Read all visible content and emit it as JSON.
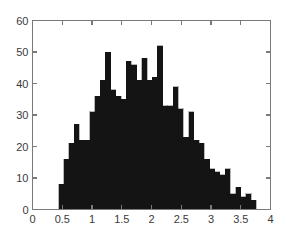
{
  "figure": {
    "background_color": "#ffffff",
    "axis_color": "#7a7a7a",
    "bar_color": "#141414",
    "tick_label_color": "#3a3a3a"
  },
  "chart_data": {
    "type": "bar",
    "title": "",
    "subtitle": "",
    "xlabel": "",
    "ylabel": "",
    "xlim": [
      0,
      4
    ],
    "ylim": [
      0,
      60
    ],
    "grid": false,
    "legend": null,
    "legend_position": "none",
    "xticks": [
      0,
      0.5,
      1,
      1.5,
      2,
      2.5,
      3,
      3.5,
      4
    ],
    "xtick_labels": [
      "0",
      "0.5",
      "1",
      "1.5",
      "2",
      "2.5",
      "3",
      "3.5",
      "4"
    ],
    "yticks": [
      0,
      10,
      20,
      30,
      40,
      50,
      60
    ],
    "ytick_labels": [
      "0",
      "10",
      "20",
      "30",
      "40",
      "50",
      "60"
    ],
    "bin_width": 0.0875,
    "bin_edges": [
      0.4375,
      0.525,
      0.6125,
      0.7,
      0.7875,
      0.875,
      0.9625,
      1.05,
      1.1375,
      1.225,
      1.3125,
      1.4,
      1.4875,
      1.575,
      1.6625,
      1.75,
      1.8375,
      1.925,
      2.0125,
      2.1,
      2.1875,
      2.275,
      2.3625,
      2.45,
      2.5375,
      2.625,
      2.7125,
      2.8,
      2.8875,
      2.975,
      3.0625,
      3.15,
      3.2375,
      3.325,
      3.4125,
      3.5,
      3.5875,
      3.675,
      3.7625
    ],
    "categories": [
      "0.44-0.53",
      "0.53-0.61",
      "0.61-0.70",
      "0.70-0.79",
      "0.79-0.88",
      "0.88-0.96",
      "0.96-1.05",
      "1.05-1.14",
      "1.14-1.23",
      "1.23-1.31",
      "1.31-1.40",
      "1.40-1.49",
      "1.49-1.58",
      "1.58-1.66",
      "1.66-1.75",
      "1.75-1.84",
      "1.84-1.93",
      "1.93-2.01",
      "2.01-2.10",
      "2.10-2.19",
      "2.19-2.28",
      "2.28-2.36",
      "2.36-2.45",
      "2.45-2.54",
      "2.54-2.63",
      "2.63-2.71",
      "2.71-2.80",
      "2.80-2.89",
      "2.89-2.98",
      "2.98-3.06",
      "3.06-3.15",
      "3.15-3.24",
      "3.24-3.33",
      "3.33-3.41",
      "3.41-3.50",
      "3.50-3.59",
      "3.59-3.68",
      "3.68-3.76"
    ],
    "values": [
      8,
      16,
      21,
      27,
      22,
      22,
      31,
      36,
      41,
      50,
      38,
      36,
      35,
      47,
      46,
      41,
      48,
      41,
      42,
      52,
      33,
      33,
      39,
      32,
      23,
      31,
      22,
      21,
      16,
      13,
      12,
      11,
      13,
      5,
      7,
      4,
      5,
      3
    ],
    "max_value": 52,
    "n_bins": 38
  }
}
